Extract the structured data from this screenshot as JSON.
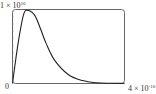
{
  "chart_data": {
    "type": "line",
    "title": "",
    "xlabel": "",
    "ylabel": "",
    "xlim": [
      0,
      4e-10
    ],
    "ylim": [
      0,
      10000000000.0
    ],
    "x_tick_labels": [
      "0",
      "4 × 10^-10"
    ],
    "y_tick_labels": [
      "1 × 10^10"
    ],
    "grid": false,
    "legend": null,
    "series": [
      {
        "name": "distribution",
        "x": [
          0,
          2e-11,
          4e-11,
          5.7e-11,
          8e-11,
          1e-10,
          1.2e-10,
          1.5e-10,
          2e-10,
          2.5e-10,
          3e-10,
          3.5e-10,
          4e-10
        ],
        "values": [
          0,
          5500000000.0,
          9500000000.0,
          10000000000.0,
          9300000000.0,
          7500000000.0,
          5500000000.0,
          3200000000.0,
          1200000000.0,
          400000000.0,
          100000000.0,
          30000000.0,
          10000000.0
        ]
      }
    ]
  },
  "labels": {
    "y_max_base": "1 × 10",
    "y_max_exp": "10",
    "origin": "0",
    "x_max_base": "4 × 10",
    "x_max_exp": "-10"
  }
}
